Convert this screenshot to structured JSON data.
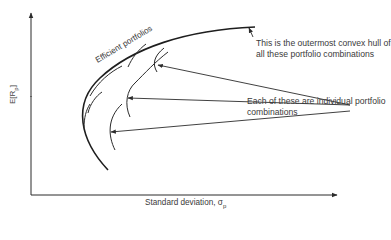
{
  "diagram": {
    "axes": {
      "y_label": "E[R",
      "y_label_sub": "p",
      "y_label_end": "]",
      "x_label": "Standard deviation, σ",
      "x_label_sub": "p"
    },
    "curves": {
      "efficient_frontier_label": "Efficient portfolios",
      "individual_combination_count": 7
    },
    "annotations": {
      "hull_note_line1": "This is the outermost convex hull of",
      "hull_note_line2": "all these portfolio combinations",
      "individual_note_line1": "Each of these are individual portfolio",
      "individual_note_line2": "combinations"
    },
    "colors": {
      "line": "#2b2b2b",
      "text": "#3a3a3a",
      "background": "#ffffff"
    }
  }
}
